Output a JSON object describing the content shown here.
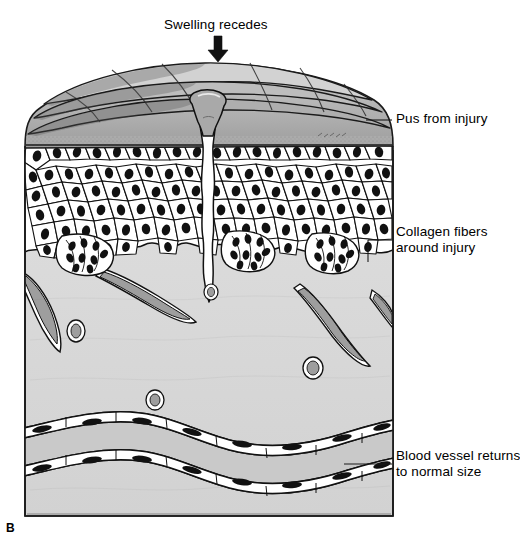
{
  "figure": {
    "type": "medical-illustration",
    "panel_letter": "B",
    "top_annotation": {
      "text": "Swelling recedes",
      "icon": "down-arrow-icon"
    },
    "callouts": [
      {
        "id": "pus",
        "line1": "Pus from injury",
        "line2": "",
        "text": "Pus from injury",
        "leader_from_x": 396,
        "leader_to_x": 366,
        "leader_y": 120
      },
      {
        "id": "collagen",
        "line1": "Collagen fibers",
        "line2": "around injury",
        "text": "Collagen fibers around injury",
        "leader_from_x": 396,
        "leader_to_x": 368,
        "leader_y": 240
      },
      {
        "id": "blood-vessel",
        "line1": "Blood vessel returns",
        "line2": "to normal size",
        "text": "Blood vessel returns to normal size",
        "leader_from_x": 396,
        "leader_to_x": 344,
        "leader_y": 464
      }
    ],
    "anatomy_layers": [
      {
        "name": "epidermis-surface-folds",
        "fill": "#b8b8b8"
      },
      {
        "name": "epidermis-cellular-layer",
        "fill": "#ffffff"
      },
      {
        "name": "dermis",
        "fill": "#d8d8d8"
      },
      {
        "name": "wound-channel",
        "fill": "#ffffff"
      },
      {
        "name": "pus-plug",
        "fill": "#a8a8a8"
      },
      {
        "name": "blood-vessel-large",
        "fill": "#c8c8c8"
      },
      {
        "name": "blood-vessel-small",
        "fill": "#9a9a9a"
      }
    ],
    "colors": {
      "outline": "#000000",
      "surface_gray": "#b5b5b5",
      "dermis_gray": "#d9d9d9",
      "vessel_gray": "#9e9e9e",
      "white": "#ffffff",
      "text": "#000000"
    }
  }
}
